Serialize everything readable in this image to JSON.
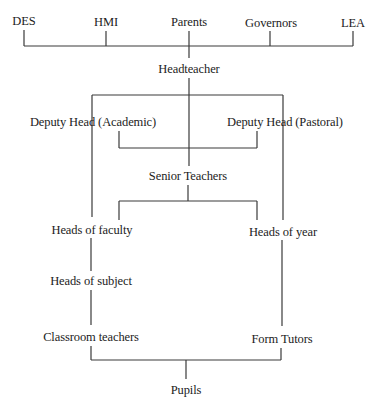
{
  "diagram": {
    "type": "organization-chart",
    "external_bodies": [
      {
        "id": "des",
        "label": "DES"
      },
      {
        "id": "hmi",
        "label": "HMI"
      },
      {
        "id": "parents",
        "label": "Parents"
      },
      {
        "id": "governors",
        "label": "Governors"
      },
      {
        "id": "lea",
        "label": "LEA"
      }
    ],
    "nodes": {
      "headteacher": "Headteacher",
      "deputy_academic": "Deputy Head (Academic)",
      "deputy_pastoral": "Deputy Head (Pastoral)",
      "senior_teachers": "Senior Teachers",
      "heads_of_faculty": "Heads of faculty",
      "heads_of_year": "Heads of  year",
      "heads_of_subject": "Heads of subject",
      "classroom_teachers": "Classroom teachers",
      "form_tutors": "Form Tutors",
      "pupils": "Pupils"
    },
    "edges": [
      [
        "DES",
        "Headteacher"
      ],
      [
        "HMI",
        "Headteacher"
      ],
      [
        "Parents",
        "Headteacher"
      ],
      [
        "Governors",
        "Headteacher"
      ],
      [
        "LEA",
        "Headteacher"
      ],
      [
        "Headteacher",
        "Deputy Head (Academic)"
      ],
      [
        "Headteacher",
        "Deputy Head (Pastoral)"
      ],
      [
        "Headteacher",
        "Senior Teachers"
      ],
      [
        "Deputy Head (Academic)",
        "Senior Teachers"
      ],
      [
        "Deputy Head (Pastoral)",
        "Senior Teachers"
      ],
      [
        "Deputy Head (Academic)",
        "Heads of faculty"
      ],
      [
        "Deputy Head (Pastoral)",
        "Heads of year"
      ],
      [
        "Senior Teachers",
        "Heads of faculty"
      ],
      [
        "Senior Teachers",
        "Heads of year"
      ],
      [
        "Heads of faculty",
        "Heads of subject"
      ],
      [
        "Heads of subject",
        "Classroom teachers"
      ],
      [
        "Heads of year",
        "Form Tutors"
      ],
      [
        "Classroom teachers",
        "Pupils"
      ],
      [
        "Form Tutors",
        "Pupils"
      ]
    ]
  }
}
